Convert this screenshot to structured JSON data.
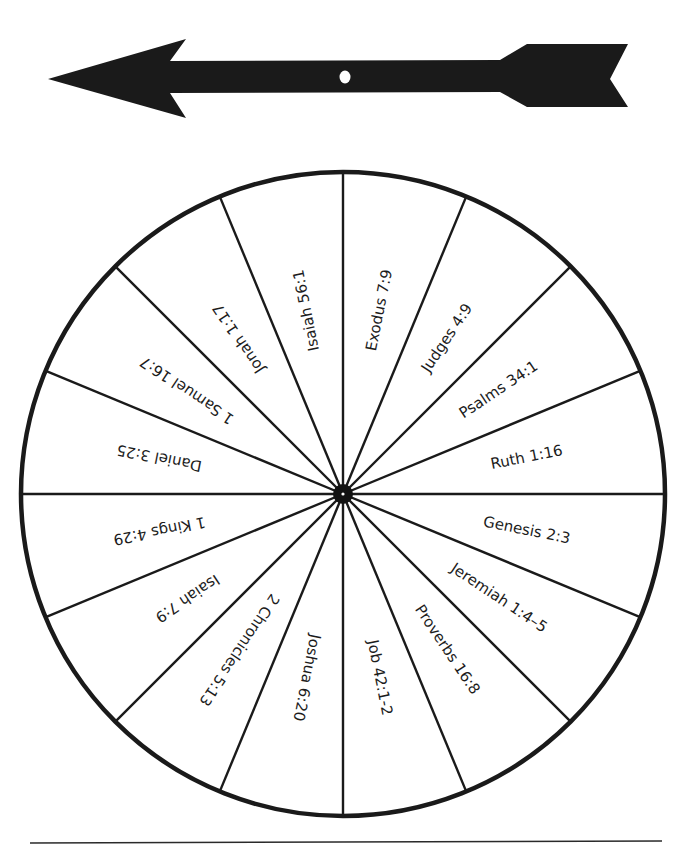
{
  "arrow": {
    "name": "spinner-arrow",
    "color": "#1a1a1a",
    "pivot_hole_color": "#ffffff"
  },
  "wheel": {
    "center": [
      343,
      494
    ],
    "radius": 323,
    "rim_color": "#1a1a1a",
    "spoke_color": "#1a1a1a",
    "hub_color": "#111111",
    "start_angle_deg": -90,
    "sectors": [
      {
        "label": "Exodus 7:9"
      },
      {
        "label": "Judges 4:9"
      },
      {
        "label": "Psalms 34:1"
      },
      {
        "label": "Ruth 1:16"
      },
      {
        "label": "Genesis 2:3"
      },
      {
        "label": "Jeremiah 1:4–5"
      },
      {
        "label": "Proverbs 16:8"
      },
      {
        "label": "Job 42:1-2"
      },
      {
        "label": "Joshua 6:20"
      },
      {
        "label": "2 Chronicles 5:13"
      },
      {
        "label": "Isaiah 7:9"
      },
      {
        "label": "1 Kings 4:29"
      },
      {
        "label": "Daniel 3:25"
      },
      {
        "label": "1 Samuel 16:7"
      },
      {
        "label": "Jonah 1:17"
      },
      {
        "label": "Isaiah 56:1"
      }
    ]
  },
  "footer": {
    "cut_line": true
  }
}
